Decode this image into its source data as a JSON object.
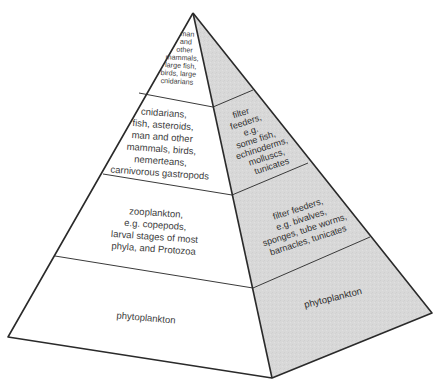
{
  "diagram": {
    "type": "trophic-pyramid",
    "shape": "square-based pyramid, two visible faces",
    "colors": {
      "left_face": "#ffffff",
      "right_face": "#d8d8d8",
      "edges": "#2a2a2a",
      "text": "#3c3c3c"
    },
    "tiers": [
      {
        "level": 1,
        "position": "apex",
        "left_face_lines": [
          "man",
          "and",
          "other",
          "mammals,",
          "large fish,",
          "birds, large",
          "cnidarians"
        ],
        "right_face_lines": []
      },
      {
        "level": 2,
        "position": "upper-middle",
        "left_face_lines": [
          "cnidarians,",
          "fish, asteroids,",
          "man and other",
          "mammals, birds,",
          "nemerteans,",
          "carnivorous gastropods"
        ],
        "right_face_lines": [
          "filter",
          "feeders,",
          "e.g.",
          "some fish,",
          "echinoderms,",
          "molluscs,",
          "tunicates"
        ]
      },
      {
        "level": 3,
        "position": "lower-middle",
        "left_face_lines": [
          "zooplankton,",
          "e.g. copepods,",
          "larval stages of most",
          "phyla, and Protozoa"
        ],
        "right_face_lines": [
          "filter feeders,",
          "e.g. bivalves,",
          "sponges, tube worms,",
          "barnacles, tunicates"
        ]
      },
      {
        "level": 4,
        "position": "base",
        "left_face_lines": [
          "phytoplankton"
        ],
        "right_face_lines": [
          "phytoplankton"
        ]
      }
    ]
  }
}
